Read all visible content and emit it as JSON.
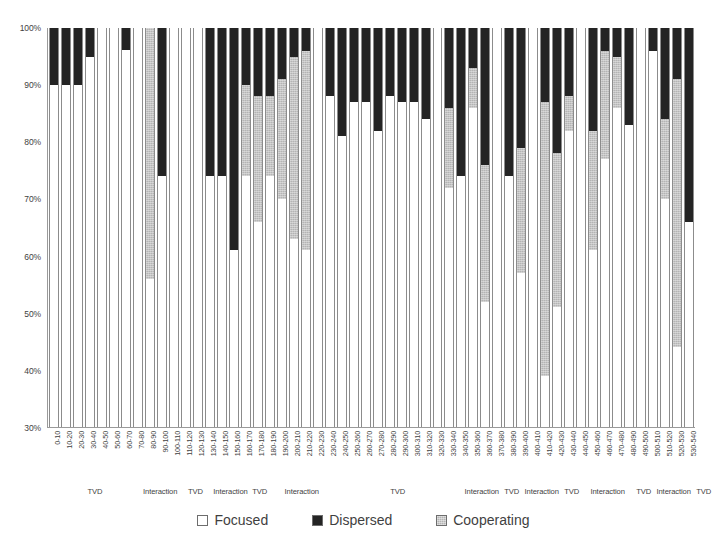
{
  "chart_data": {
    "type": "bar",
    "subtype": "stacked-bar-100-percent",
    "title": "",
    "xlabel": "",
    "ylabel": "",
    "ylim": [
      30,
      100
    ],
    "y_ticks": [
      100,
      90,
      80,
      70,
      60,
      50,
      40,
      30
    ],
    "y_tick_labels": [
      "100%",
      "90%",
      "80%",
      "70%",
      "60%",
      "50%",
      "40%",
      "30%"
    ],
    "grid": false,
    "legend_position": "bottom",
    "series_order": [
      "Focused",
      "Dispersed",
      "Cooperating"
    ],
    "series": [
      {
        "name": "Focused",
        "color": "#ffffff",
        "values": [
          90,
          90,
          90,
          95,
          100,
          100,
          100,
          100,
          56,
          74,
          100,
          100,
          100,
          74,
          74,
          61,
          74,
          66,
          74,
          70,
          63,
          61,
          100,
          88,
          81,
          87,
          87,
          82,
          88,
          87,
          87,
          84,
          100,
          72,
          74,
          86,
          52,
          100,
          74,
          57,
          100,
          39,
          51,
          82,
          100,
          61,
          77,
          86,
          83,
          100,
          96,
          70,
          44,
          66
        ]
      },
      {
        "name": "Dispersed",
        "color": "#242424",
        "values": [
          10,
          10,
          10,
          5,
          0,
          0,
          4,
          0,
          0,
          26,
          0,
          0,
          0,
          26,
          26,
          39,
          10,
          12,
          12,
          9,
          5,
          4,
          0,
          12,
          19,
          13,
          13,
          18,
          12,
          13,
          13,
          16,
          0,
          14,
          26,
          7,
          24,
          0,
          26,
          21,
          0,
          13,
          22,
          12,
          0,
          18,
          4,
          5,
          17,
          0,
          4,
          16,
          9,
          34
        ]
      },
      {
        "name": "Cooperating",
        "color": "#b4b4b4",
        "values": [
          0,
          0,
          0,
          0,
          0,
          0,
          0,
          0,
          44,
          0,
          0,
          0,
          0,
          0,
          0,
          0,
          16,
          22,
          14,
          21,
          32,
          35,
          0,
          0,
          0,
          0,
          0,
          0,
          0,
          0,
          0,
          0,
          0,
          14,
          0,
          7,
          24,
          0,
          0,
          22,
          0,
          48,
          27,
          6,
          0,
          21,
          19,
          9,
          0,
          0,
          0,
          14,
          47,
          0
        ]
      }
    ],
    "categories": [
      "0-10",
      "10-20",
      "20-30",
      "30-40",
      "40-50",
      "50-60",
      "60-70",
      "70-80",
      "80-90",
      "90-100",
      "100-110",
      "110-120",
      "120-130",
      "130-140",
      "140-150",
      "150-160",
      "160-170",
      "170-180",
      "180-190",
      "190-200",
      "200-210",
      "210-220",
      "220-230",
      "230-240",
      "240-250",
      "250-260",
      "260-270",
      "270-280",
      "280-290",
      "290-300",
      "300-310",
      "310-320",
      "320-330",
      "330-340",
      "340-350",
      "350-360",
      "360-370",
      "370-380",
      "380-390",
      "390-400",
      "400-410",
      "410-420",
      "420-430",
      "430-440",
      "440-450",
      "450-460",
      "460-470",
      "470-480",
      "480-490",
      "490-500",
      "500-510",
      "510-520",
      "520-530",
      "530-540"
    ],
    "group_bands": [
      {
        "label": "TVD",
        "span": 8
      },
      {
        "label": "Interaction",
        "span": 2
      },
      {
        "label": "TVD",
        "span": 3
      },
      {
        "label": "Interaction",
        "span": 2
      },
      {
        "label": "TVD",
        "span": 2
      },
      {
        "label": "Interaction",
        "span": 5
      },
      {
        "label": "TVD",
        "span": 11
      },
      {
        "label": "Interaction",
        "span": 3
      },
      {
        "label": "TVD",
        "span": 2
      },
      {
        "label": "Interaction",
        "span": 3
      },
      {
        "label": "TVD",
        "span": 2
      },
      {
        "label": "Interaction",
        "span": 4
      },
      {
        "label": "TVD",
        "span": 2
      },
      {
        "label": "Interaction",
        "span": 3
      },
      {
        "label": "TVD",
        "span": 2
      }
    ]
  },
  "legend": {
    "items": [
      {
        "label": "Focused",
        "swatch": "focused"
      },
      {
        "label": "Dispersed",
        "swatch": "dispersed"
      },
      {
        "label": "Cooperating",
        "swatch": "cooperating"
      }
    ]
  },
  "colors": {
    "focused": "#ffffff",
    "dispersed": "#242424",
    "cooperating": "#b4b4b4",
    "axis": "#9a9a9a",
    "text": "#3f3f3f"
  }
}
